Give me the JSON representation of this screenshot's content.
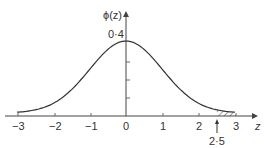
{
  "chart_data": {
    "type": "line",
    "title": "",
    "xlabel": "z",
    "ylabel": "ϕ(z)",
    "function": "standard normal density",
    "x": [
      -3,
      -2.5,
      -2,
      -1.5,
      -1,
      -0.5,
      0,
      0.5,
      1,
      1.5,
      2,
      2.5,
      3
    ],
    "values": [
      0.0044,
      0.0175,
      0.054,
      0.1295,
      0.242,
      0.3521,
      0.3989,
      0.3521,
      0.242,
      0.1295,
      0.054,
      0.0175,
      0.0044
    ],
    "xlim": [
      -3,
      3
    ],
    "ylim": [
      0,
      0.4
    ],
    "x_ticks": [
      "−3",
      "−2",
      "−1",
      "0",
      "1",
      "2",
      "3"
    ],
    "y_ticks_labeled": [
      "0·4"
    ],
    "shaded_region": {
      "from": 2.5,
      "to": 3,
      "style": "hatched"
    },
    "annotation": {
      "label": "2·5",
      "x": 2.5,
      "arrow": "up"
    },
    "grid": false
  },
  "labels": {
    "ylabel": "ϕ(z)",
    "xlabel": "z",
    "ytick": "0·4",
    "annotation": "2·5",
    "xticks": [
      "−3",
      "−2",
      "−1",
      "0",
      "1",
      "2",
      "3"
    ]
  }
}
